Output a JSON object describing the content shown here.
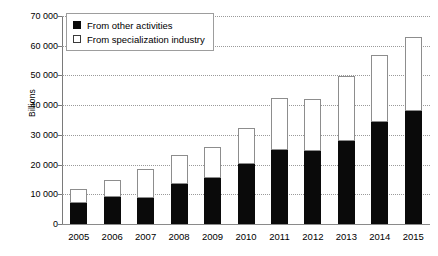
{
  "chart_data": {
    "type": "bar",
    "stacked": true,
    "title": "",
    "xlabel": "",
    "ylabel": "Billions",
    "ylim": [
      0,
      70000
    ],
    "ytick_step": 10000,
    "ytick_labels": [
      "0",
      "10 000",
      "20 000",
      "30 000",
      "40 000",
      "50 000",
      "60 000",
      "70 000"
    ],
    "ytick_values": [
      0,
      10000,
      20000,
      30000,
      40000,
      50000,
      60000,
      70000
    ],
    "grid": true,
    "legend_position": "top-left",
    "categories": [
      "2005",
      "2006",
      "2007",
      "2008",
      "2009",
      "2010",
      "2011",
      "2012",
      "2013",
      "2014",
      "2015"
    ],
    "series": [
      {
        "name": "From other activities",
        "color": "#0a0a0a",
        "values": [
          7100,
          9200,
          8800,
          13600,
          15400,
          20200,
          24900,
          24700,
          27900,
          34300,
          37900
        ]
      },
      {
        "name": "From specialization industry",
        "color": "#ffffff",
        "values": [
          4700,
          5600,
          9700,
          9600,
          10500,
          12100,
          17500,
          17500,
          21900,
          22600,
          25200
        ]
      }
    ],
    "totals": [
      11800,
      14800,
      18500,
      23200,
      25900,
      32300,
      42400,
      42200,
      49800,
      56900,
      63100
    ]
  },
  "legend": {
    "items": [
      {
        "label": "From other activities",
        "swatch": "black"
      },
      {
        "label": "From specialization industry",
        "swatch": "white"
      }
    ]
  }
}
